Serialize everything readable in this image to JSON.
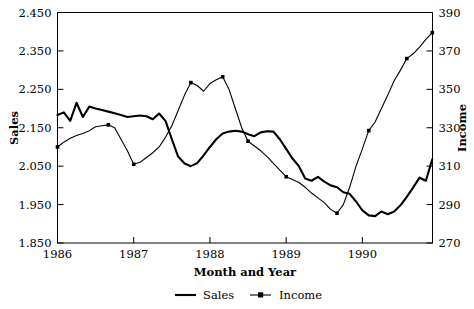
{
  "chart_data": {
    "type": "line",
    "title": "",
    "xlabel": "Month and Year",
    "ylabel": "Sales",
    "y2label": "Income",
    "grid": false,
    "legend_position": "bottom",
    "x_tick_labels": [
      "1986",
      "1987",
      "1988",
      "1989",
      "1990"
    ],
    "x_tick_values": [
      1986,
      1987,
      1988,
      1989,
      1990
    ],
    "xlim": [
      1986.0,
      1990.92
    ],
    "y_tick_labels": [
      "1.850",
      "1.950",
      "2.050",
      "2.150",
      "2.250",
      "2.350",
      "2.450"
    ],
    "y_tick_values": [
      1.85,
      1.95,
      2.05,
      2.15,
      2.25,
      2.35,
      2.45
    ],
    "ylim": [
      1.85,
      2.45
    ],
    "y2_tick_labels": [
      "270",
      "290",
      "310",
      "330",
      "350",
      "370",
      "390"
    ],
    "y2_tick_values": [
      270,
      290,
      310,
      330,
      350,
      370,
      390
    ],
    "y2lim": [
      270,
      390
    ],
    "series": [
      {
        "name": "Sales",
        "axis": "left",
        "markers": false,
        "x": [
          1986.0,
          1986.083,
          1986.167,
          1986.25,
          1986.333,
          1986.417,
          1986.5,
          1986.583,
          1986.667,
          1986.75,
          1986.833,
          1986.917,
          1987.0,
          1987.083,
          1987.167,
          1987.25,
          1987.333,
          1987.417,
          1987.5,
          1987.583,
          1987.667,
          1987.75,
          1987.833,
          1987.917,
          1988.0,
          1988.083,
          1988.167,
          1988.25,
          1988.333,
          1988.417,
          1988.5,
          1988.583,
          1988.667,
          1988.75,
          1988.833,
          1988.917,
          1989.0,
          1989.083,
          1989.167,
          1989.25,
          1989.333,
          1989.417,
          1989.5,
          1989.583,
          1989.667,
          1989.75,
          1989.833,
          1989.917,
          1990.0,
          1990.083,
          1990.167,
          1990.25,
          1990.333,
          1990.417,
          1990.5,
          1990.583,
          1990.667,
          1990.75,
          1990.833,
          1990.917
        ],
        "y": [
          2.183,
          2.19,
          2.168,
          2.215,
          2.178,
          2.205,
          2.2,
          2.196,
          2.192,
          2.188,
          2.183,
          2.178,
          2.18,
          2.182,
          2.18,
          2.172,
          2.187,
          2.168,
          2.12,
          2.075,
          2.057,
          2.05,
          2.058,
          2.078,
          2.1,
          2.12,
          2.135,
          2.14,
          2.142,
          2.14,
          2.133,
          2.128,
          2.138,
          2.141,
          2.14,
          2.12,
          2.095,
          2.07,
          2.05,
          2.018,
          2.012,
          2.022,
          2.01,
          2.0,
          1.995,
          1.982,
          1.978,
          1.958,
          1.935,
          1.922,
          1.92,
          1.932,
          1.925,
          1.932,
          1.948,
          1.97,
          1.995,
          2.02,
          2.012,
          2.068
        ]
      },
      {
        "name": "Income",
        "axis": "right",
        "markers": true,
        "marker_interval_months": 6,
        "x": [
          1986.0,
          1986.083,
          1986.167,
          1986.25,
          1986.333,
          1986.417,
          1986.5,
          1986.583,
          1986.667,
          1986.75,
          1986.833,
          1986.917,
          1987.0,
          1987.083,
          1987.167,
          1987.25,
          1987.333,
          1987.417,
          1987.5,
          1987.583,
          1987.667,
          1987.75,
          1987.833,
          1987.917,
          1988.0,
          1988.083,
          1988.167,
          1988.25,
          1988.333,
          1988.417,
          1988.5,
          1988.583,
          1988.667,
          1988.75,
          1988.833,
          1988.917,
          1989.0,
          1989.083,
          1989.167,
          1989.25,
          1989.333,
          1989.417,
          1989.5,
          1989.583,
          1989.667,
          1989.75,
          1989.833,
          1989.917,
          1990.0,
          1990.083,
          1990.167,
          1990.25,
          1990.333,
          1990.417,
          1990.5,
          1990.583,
          1990.667,
          1990.75,
          1990.833,
          1990.917
        ],
        "y": [
          320.0,
          322.5,
          324.5,
          326.0,
          327.0,
          328.5,
          330.5,
          331.0,
          331.5,
          330.0,
          324.0,
          318.0,
          311.0,
          312.0,
          314.5,
          317.0,
          320.0,
          325.0,
          331.0,
          339.0,
          347.0,
          353.5,
          352.0,
          349.0,
          353.0,
          355.0,
          356.5,
          350.0,
          340.0,
          330.0,
          323.0,
          320.5,
          318.0,
          315.0,
          311.5,
          308.0,
          304.5,
          303.0,
          301.5,
          299.0,
          296.0,
          293.5,
          291.0,
          287.5,
          285.5,
          290.0,
          299.0,
          310.0,
          319.0,
          328.5,
          333.0,
          340.0,
          347.0,
          354.5,
          360.0,
          366.0,
          368.5,
          372.0,
          376.0,
          379.5
        ]
      }
    ],
    "marker_points": [
      {
        "series": "Income",
        "x": 1986.0,
        "y": 320.0
      },
      {
        "series": "Income",
        "x": 1986.667,
        "y": 331.5
      },
      {
        "series": "Income",
        "x": 1987.0,
        "y": 311.0
      },
      {
        "series": "Income",
        "x": 1987.75,
        "y": 353.5
      },
      {
        "series": "Income",
        "x": 1988.167,
        "y": 356.5
      },
      {
        "series": "Income",
        "x": 1988.5,
        "y": 323.0
      },
      {
        "series": "Income",
        "x": 1989.0,
        "y": 304.5
      },
      {
        "series": "Income",
        "x": 1989.667,
        "y": 285.5
      },
      {
        "series": "Income",
        "x": 1990.083,
        "y": 328.5
      },
      {
        "series": "Income",
        "x": 1990.583,
        "y": 366.0
      },
      {
        "series": "Income",
        "x": 1990.917,
        "y": 379.5
      }
    ]
  },
  "legend": {
    "items": [
      {
        "label": "Sales",
        "style": "line"
      },
      {
        "label": "Income",
        "style": "line-marker"
      }
    ]
  }
}
